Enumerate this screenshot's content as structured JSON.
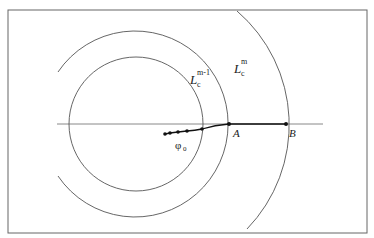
{
  "diagram": {
    "frame": {
      "x": 8,
      "y": 10,
      "width": 359,
      "height": 223,
      "stroke": "#666666"
    },
    "axis": {
      "x1": 57,
      "x2": 323,
      "y": 124,
      "stroke": "#888888"
    },
    "center": {
      "x": 136,
      "y": 124
    },
    "curves": [
      {
        "name": "inner-circle",
        "radius": 67
      },
      {
        "name": "level-set-m-minus-1",
        "radius": 93
      },
      {
        "name": "level-set-m",
        "radius": 150
      }
    ],
    "path_points": [
      {
        "x": 165,
        "y": 134
      },
      {
        "x": 170,
        "y": 133
      },
      {
        "x": 178,
        "y": 132
      },
      {
        "x": 187,
        "y": 131
      },
      {
        "x": 202,
        "y": 129
      },
      {
        "x": 229,
        "y": 124
      },
      {
        "x": 286,
        "y": 124
      }
    ],
    "labels": {
      "L_m_minus_1": {
        "main": "L",
        "sub": "c",
        "sup": "m-1"
      },
      "L_m": {
        "main": "L",
        "sub": "c",
        "sup": "m"
      },
      "point_A": "A",
      "point_B": "B",
      "phi0": {
        "main": "φ",
        "sub": "0"
      }
    }
  }
}
